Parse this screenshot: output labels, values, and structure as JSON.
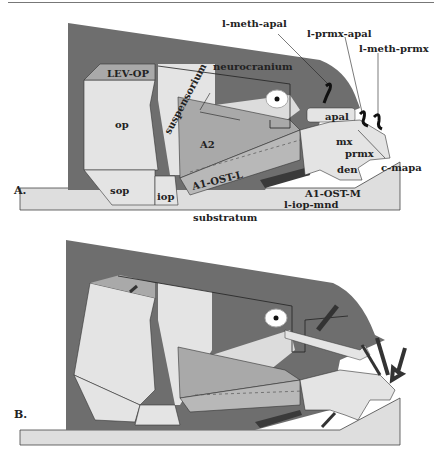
{
  "colors": {
    "dark": "#6e6e6e",
    "mid": "#a9a9a9",
    "light": "#dedede",
    "lighter": "#e8e8e8",
    "ink": "#222222",
    "background": "#ffffff"
  },
  "panelA": {
    "label": "A.",
    "labels": {
      "neurocranium": "neurocranium",
      "lev_op": "LEV-OP",
      "op": "op",
      "sop": "sop",
      "iop": "iop",
      "suspensorium": "suspensorium",
      "a2": "A2",
      "a1_ost_l": "A1-OST-L",
      "a1_ost_m": "A1-OST-M",
      "l_iop_mnd": "l-iop-mnd",
      "substratum": "substratum",
      "apal": "apal",
      "mx": "mx",
      "prmx": "prmx",
      "den": "den",
      "c_mapa": "c-mapa",
      "l_meth_apal": "l-meth-apal",
      "l_prmx_apal": "l-prmx-apal",
      "l_meth_prmx": "l-meth-prmx"
    }
  },
  "panelB": {
    "label": "B."
  }
}
